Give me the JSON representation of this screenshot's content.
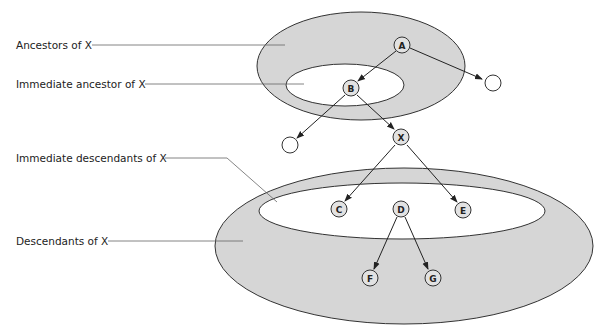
{
  "labels": {
    "ancestors": "Ancestors of X",
    "immediate_ancestor": "Immediate ancestor of X",
    "immediate_descendants": "Immediate descendants of X",
    "descendants": "Descendants of X"
  },
  "nodes": {
    "A": "A",
    "B": "B",
    "X": "X",
    "C": "C",
    "D": "D",
    "E": "E",
    "F": "F",
    "G": "G"
  },
  "colors": {
    "set_fill": "#d6d6d6",
    "inner_fill": "#ffffff",
    "stroke": "#333333",
    "node_fill": "#e2e2e2"
  }
}
